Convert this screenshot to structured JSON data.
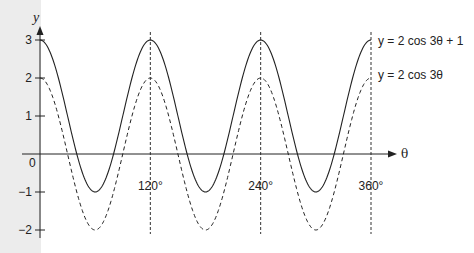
{
  "chart_data": {
    "type": "line",
    "title": "",
    "xlabel": "θ",
    "ylabel": "y",
    "x_unit": "degrees",
    "xlim": [
      0,
      360
    ],
    "ylim": [
      -2,
      3
    ],
    "grid": false,
    "x_ticks": [
      {
        "value": 120,
        "label": "120°"
      },
      {
        "value": 240,
        "label": "240°"
      },
      {
        "value": 360,
        "label": "360°"
      }
    ],
    "y_ticks": [
      {
        "value": 3,
        "label": "3"
      },
      {
        "value": 2,
        "label": "2"
      },
      {
        "value": 1,
        "label": "1"
      },
      {
        "value": 0,
        "label": "0"
      },
      {
        "value": -1,
        "label": "-1"
      },
      {
        "value": -2,
        "label": "-2"
      }
    ],
    "vertical_reference_lines": [
      120,
      240,
      360
    ],
    "series": [
      {
        "name": "y = 2 cos 3θ + 1",
        "style": "solid",
        "formula": "2*cos(3θ)+1",
        "x": [
          0,
          30,
          60,
          90,
          120,
          150,
          180,
          210,
          240,
          270,
          300,
          330,
          360
        ],
        "values": [
          3,
          1,
          -1,
          1,
          3,
          1,
          -1,
          1,
          3,
          1,
          -1,
          1,
          3
        ]
      },
      {
        "name": "y = 2 cos 3θ",
        "style": "dashed",
        "formula": "2*cos(3θ)",
        "x": [
          0,
          30,
          60,
          90,
          120,
          150,
          180,
          210,
          240,
          270,
          300,
          330,
          360
        ],
        "values": [
          2,
          0,
          -2,
          0,
          2,
          0,
          -2,
          0,
          2,
          0,
          -2,
          0,
          2
        ]
      }
    ],
    "legend": {
      "position": "inline-right",
      "entries": [
        "y = 2 cos 3θ + 1",
        "y = 2 cos 3θ"
      ]
    }
  },
  "labels": {
    "y_axis": "y",
    "x_axis": "θ",
    "origin": "0",
    "legend_solid": "y = 2 cos 3θ + 1",
    "legend_dashed": "y = 2 cos 3θ"
  },
  "colors": {
    "line": "#1a1a1a",
    "band": "#ececec"
  }
}
